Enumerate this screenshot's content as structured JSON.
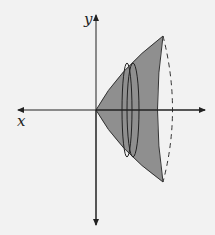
{
  "diagram": {
    "axes": {
      "x_label": "x",
      "y_label": "y"
    },
    "colors": {
      "background": "#f2f2f2",
      "region_fill": "#8f8f8f",
      "stroke": "#222222"
    }
  }
}
